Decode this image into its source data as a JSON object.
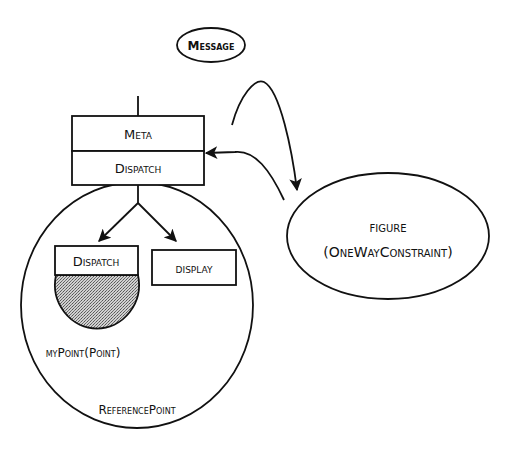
{
  "diagram": {
    "colors": {
      "ink": "#111111",
      "background": "#ffffff",
      "shaded_fill": "#b8b8b8"
    },
    "message_node": {
      "label": "Message"
    },
    "meta_stack": {
      "top_label": "Meta",
      "bottom_label": "Dispatch"
    },
    "reference_point": {
      "label": "ReferencePoint",
      "children": [
        {
          "label": "Dispatch"
        },
        {
          "label": "display"
        }
      ],
      "inner_object": {
        "label": "myPoint(Point)"
      }
    },
    "figure_node": {
      "line1": "figure",
      "line2": "(OneWayConstraint)"
    },
    "edges": [
      {
        "from": "Meta",
        "to": "figure",
        "type": "curved-arrow"
      },
      {
        "from": "figure",
        "to": "Dispatch",
        "type": "curved-arrow"
      },
      {
        "from": "Dispatch",
        "to": "Dispatch (inner)",
        "type": "arrow"
      },
      {
        "from": "Dispatch",
        "to": "display",
        "type": "arrow"
      }
    ]
  }
}
